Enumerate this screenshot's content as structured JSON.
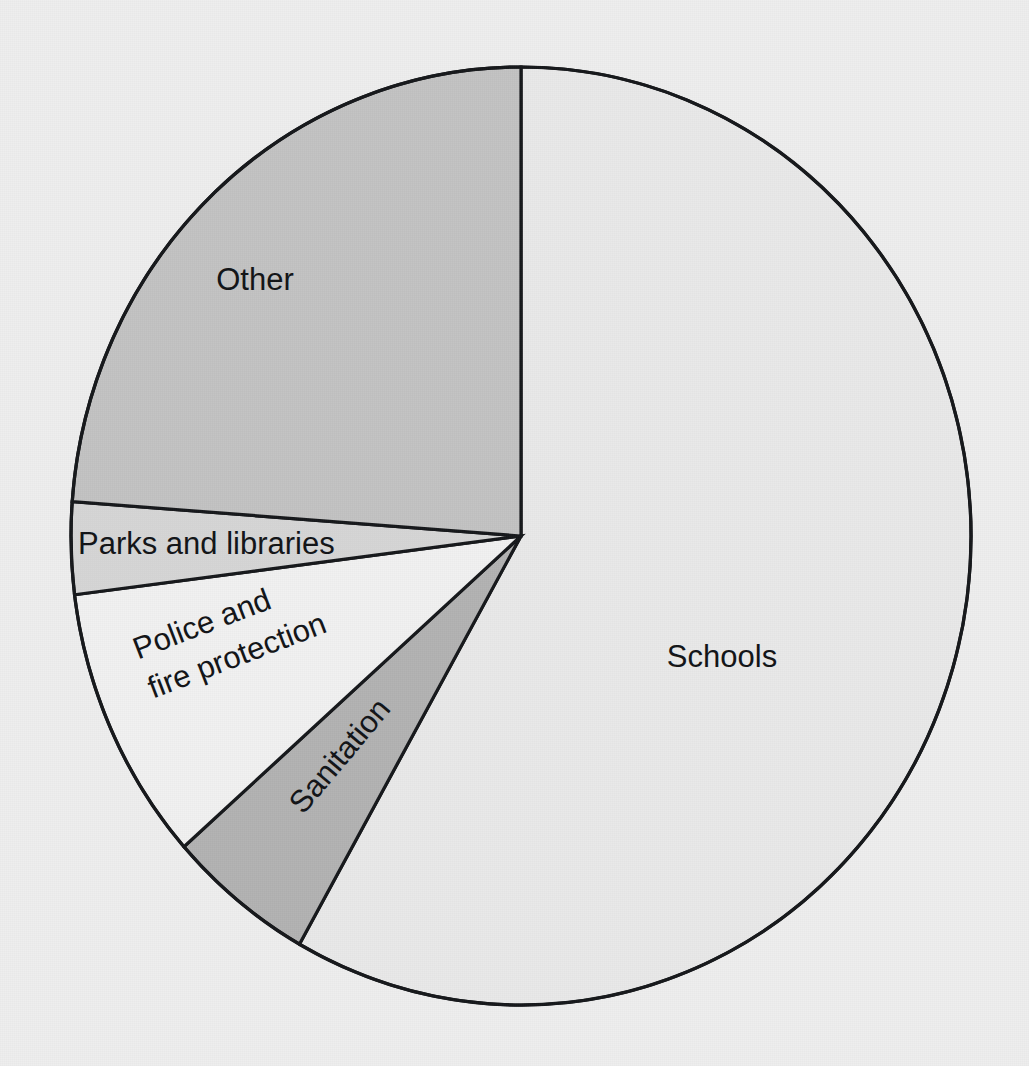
{
  "figure": {
    "background_color": "#eeeeee",
    "outline_color": "#15171a"
  },
  "chart_data": {
    "type": "pie",
    "title": "",
    "subtitle": "",
    "xlabel": "",
    "ylabel": "",
    "legend_position": "none",
    "grid": false,
    "start_angle_deg": 0,
    "direction": "clockwise",
    "labels_inside_slices": true,
    "categories": [
      "Schools",
      "Sanitation",
      "Police and fire protection",
      "Parks and libraries",
      "Other"
    ],
    "values": [
      58,
      5,
      9.5,
      3.5,
      24
    ],
    "units": "percent",
    "colors": [
      "#e9e9e9",
      "#b2b2b2",
      "#f1f1f1",
      "#d6d6d6",
      "#c2c2c2"
    ],
    "slices": [
      {
        "label": "Schools",
        "value": 58,
        "start_deg": 0,
        "end_deg": 209.5,
        "color": "#e9e9e9",
        "label_x": 722,
        "label_y": 659,
        "label_rotation": 0
      },
      {
        "label": "Sanitation",
        "value": 5,
        "start_deg": 209.5,
        "end_deg": 228.5,
        "color": "#b2b2b2",
        "label_x": 297,
        "label_y": 810,
        "label_rotation": -50
      },
      {
        "label": "Police and fire protection",
        "value": 9.5,
        "start_deg": 228.5,
        "end_deg": 262.8,
        "color": "#f1f1f1",
        "label_line1": "Police and",
        "label_line2": "fire protection",
        "label_x": 135,
        "label_y": 652,
        "label_rotation": -21
      },
      {
        "label": "Parks and libraries",
        "value": 3.5,
        "start_deg": 262.8,
        "end_deg": 274.2,
        "color": "#d6d6d6",
        "label_x": 78,
        "label_y": 544,
        "label_rotation": 0
      },
      {
        "label": "Other",
        "value": 24,
        "start_deg": 274.2,
        "end_deg": 360,
        "color": "#c2c2c2",
        "label_x": 255,
        "label_y": 282,
        "label_rotation": 0
      }
    ],
    "geometry": {
      "center_x": 521,
      "center_y": 536,
      "radius_x": 450,
      "radius_y": 469
    }
  },
  "labels": {
    "schools": "Schools",
    "sanitation": "Sanitation",
    "police_line1": "Police and",
    "police_line2": "fire protection",
    "parks": "Parks and libraries",
    "other": "Other"
  }
}
